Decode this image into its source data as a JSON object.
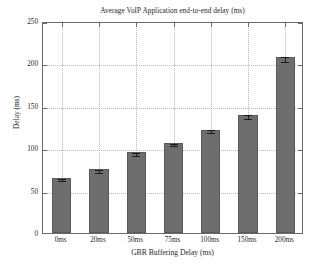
{
  "chart_data": {
    "type": "bar",
    "title": "Average VoIP Application end-to-end delay (ms)",
    "xlabel": "GBR Buffering Delay (ms)",
    "ylabel": "Delay (ms)",
    "categories": [
      "0ms",
      "20ms",
      "50ms",
      "75ms",
      "100ms",
      "150ms",
      "200ms"
    ],
    "values": [
      65,
      75,
      95,
      106,
      122,
      139,
      207
    ],
    "errors": [
      1.5,
      1.5,
      1.5,
      1.5,
      1.5,
      2.0,
      3.0
    ],
    "ylim": [
      0,
      250
    ],
    "yticks": [
      0,
      50,
      100,
      150,
      200,
      250
    ],
    "ytick_labels": [
      "0",
      "50",
      "100",
      "150",
      "200",
      "250"
    ],
    "grid": true,
    "legend": "none",
    "bar_color": "#6e6e6e",
    "bar_edge_color": "#5a5a5a",
    "grid_color": "#b9b9b9",
    "axis_color": "#6a6a6a",
    "background": "#ffffff"
  }
}
